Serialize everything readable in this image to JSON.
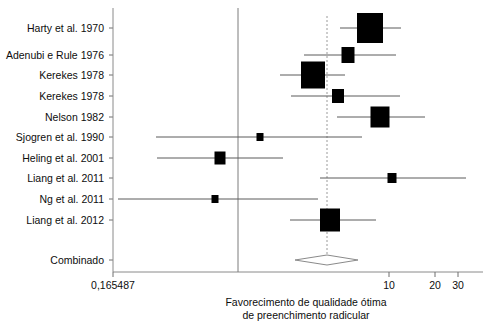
{
  "chart_data": {
    "type": "forest",
    "title": "",
    "xlabel": "Favorecimento de qualidade ótima de preenchimento radicular",
    "ylabel": "",
    "x_scale": "log",
    "xlim": [
      0.165487,
      35
    ],
    "x_ticks": [
      {
        "label": "0,165487",
        "value": 0.165487,
        "px": 113
      },
      {
        "label": "10",
        "value": 10,
        "px": 389
      },
      {
        "label": "20",
        "value": 20,
        "px": 435
      },
      {
        "label": "30",
        "value": 30,
        "px": 458
      }
    ],
    "null_line_value": 1.0,
    "null_line_px": 238,
    "pooled_line_px": 327,
    "grid": false,
    "legend": "none",
    "categories": [
      "Harty et al. 1970",
      "Adenubi e Rule 1976",
      "Kerekes 1978",
      "Kerekes 1978",
      "Nelson 1982",
      "Sjogren et al. 1990",
      "Heling et al. 2001",
      "Liang et al. 2011",
      "Ng et al. 2011",
      "Liang et al. 2012"
    ],
    "studies": [
      {
        "label": "Harty et al. 1970",
        "y_px": 28,
        "center_px": 370,
        "lo_px": 340,
        "hi_px": 401,
        "box_w": 26,
        "box_h": 30
      },
      {
        "label": "Adenubi e Rule 1976",
        "y_px": 55,
        "center_px": 348,
        "lo_px": 304,
        "hi_px": 396,
        "box_w": 13,
        "box_h": 16
      },
      {
        "label": "Kerekes 1978",
        "y_px": 75,
        "center_px": 313,
        "lo_px": 280,
        "hi_px": 345,
        "box_w": 24,
        "box_h": 27
      },
      {
        "label": "Kerekes 1978",
        "y_px": 96,
        "center_px": 338,
        "lo_px": 291,
        "hi_px": 400,
        "box_w": 12,
        "box_h": 14
      },
      {
        "label": "Nelson 1982",
        "y_px": 117,
        "center_px": 380,
        "lo_px": 337,
        "hi_px": 425,
        "box_w": 19,
        "box_h": 21
      },
      {
        "label": "Sjogren et al. 1990",
        "y_px": 137,
        "center_px": 260,
        "lo_px": 156,
        "hi_px": 362,
        "box_w": 7,
        "box_h": 8
      },
      {
        "label": "Heling et al. 2001",
        "y_px": 158,
        "center_px": 220,
        "lo_px": 157,
        "hi_px": 283,
        "box_w": 11,
        "box_h": 13
      },
      {
        "label": "Liang et al. 2011",
        "y_px": 178,
        "center_px": 392,
        "lo_px": 320,
        "hi_px": 466,
        "box_w": 9,
        "box_h": 10
      },
      {
        "label": "Ng et al. 2011",
        "y_px": 199,
        "center_px": 215,
        "lo_px": 118,
        "hi_px": 318,
        "box_w": 7,
        "box_h": 8
      },
      {
        "label": "Liang et al. 2012",
        "y_px": 220,
        "center_px": 330,
        "lo_px": 290,
        "hi_px": 376,
        "box_w": 20,
        "box_h": 23
      }
    ],
    "combined": {
      "label": "Combinado",
      "y_px": 260,
      "center_px": 327,
      "lo_px": 295,
      "hi_px": 358,
      "diamond_half_height": 5
    },
    "plot_area": {
      "left_px": 113,
      "right_px": 483,
      "top_px": 8,
      "bottom_px": 272
    },
    "caption_lines": [
      "Favorecimento de qualidade ótima",
      "de preenchimento radicular"
    ]
  },
  "colors": {
    "marker": "#000000",
    "ci_line": "#5a5a5a",
    "null_line": "#7d7d7d",
    "pooled_line": "#9a9a9a",
    "frame": "#8a8a8a",
    "text": "#0d0d0d",
    "background": "#ffffff"
  }
}
